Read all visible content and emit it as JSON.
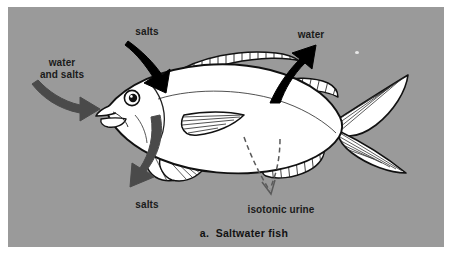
{
  "figure": {
    "caption": "a.  Saltwater fish",
    "background_color": "#9a9a9a",
    "page_color": "#ffffff"
  },
  "labels": {
    "salts_top": "salts",
    "water_top": "water",
    "water_and_salts": "water\nand salts",
    "salts_bottom": "salts",
    "isotonic_urine": "isotonic urine"
  },
  "arrows": [
    {
      "name": "salts-in-arrow",
      "label": "salts",
      "style": "solid",
      "color": "#000000",
      "direction": "down-right",
      "meaning": "salts enter through gills"
    },
    {
      "name": "water-out-arrow",
      "label": "water",
      "style": "solid",
      "color": "#000000",
      "direction": "up-right",
      "meaning": "water leaves the body"
    },
    {
      "name": "water-and-salts-in-arrow",
      "label": "water and salts",
      "style": "solid",
      "color": "#4a4a4a",
      "direction": "right",
      "meaning": "water and salts taken in by mouth"
    },
    {
      "name": "salts-out-arrow",
      "label": "salts",
      "style": "solid",
      "color": "#4a4a4a",
      "direction": "down-left",
      "meaning": "salts excreted from gills"
    },
    {
      "name": "isotonic-urine-arrow",
      "label": "isotonic urine",
      "style": "dashed",
      "color": "#5a5a5a",
      "direction": "down",
      "meaning": "small amount of isotonic urine excreted"
    }
  ],
  "fish": {
    "body_color": "#ffffff",
    "outline_color": "#111111",
    "parts": [
      "eye",
      "mouth",
      "gill-cover",
      "dorsal-fin",
      "pectoral-fin",
      "pelvic-fin",
      "anal-fin",
      "caudal-fin"
    ]
  }
}
